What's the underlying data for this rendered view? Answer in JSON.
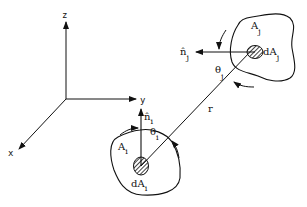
{
  "diagram": {
    "type": "view-factor-geometry",
    "axes": {
      "x_label": "x",
      "y_label": "y",
      "z_label": "z"
    },
    "surface_i": {
      "area_label": "A",
      "area_sub": "i",
      "element_label": "dA",
      "element_sub": "i",
      "normal_label": "n̂",
      "normal_sub": "i",
      "angle_label": "θ",
      "angle_sub": "i"
    },
    "surface_j": {
      "area_label": "A",
      "area_sub": "j",
      "element_label": "dA",
      "element_sub": "j",
      "normal_label": "n̂",
      "normal_sub": "j",
      "angle_label": "θ",
      "angle_sub": "j"
    },
    "distance_label": "r",
    "colors": {
      "line": "#111111",
      "background": "#ffffff"
    }
  }
}
